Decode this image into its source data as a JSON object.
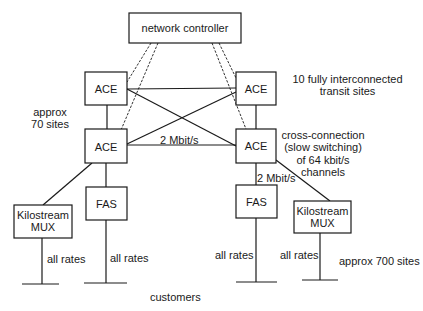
{
  "diagram": {
    "nodes": {
      "controller": "network controller",
      "ace_top_left": "ACE",
      "ace_top_right": "ACE",
      "ace_bottom_left": "ACE",
      "ace_bottom_right": "ACE",
      "fas_left": "FAS",
      "fas_right": "FAS",
      "mux_left": [
        "Kilostream",
        "MUX"
      ],
      "mux_right": [
        "Kilostream",
        "MUX"
      ]
    },
    "labels": {
      "transit": [
        "10 fully interconnected",
        "transit sites"
      ],
      "approx70": [
        "approx",
        "70 sites"
      ],
      "link_2mbit_core": "2 Mbit/s",
      "link_2mbit_fas": "2 Mbit/s",
      "crossconn": [
        "cross-connection",
        "(slow switching)",
        "of 64 kbit/s",
        "channels"
      ],
      "all_rates_1": "all rates",
      "all_rates_2": "all rates",
      "all_rates_3": "all rates",
      "all_rates_4": "all rates",
      "approx700": "approx 700 sites",
      "customers": "customers"
    }
  }
}
